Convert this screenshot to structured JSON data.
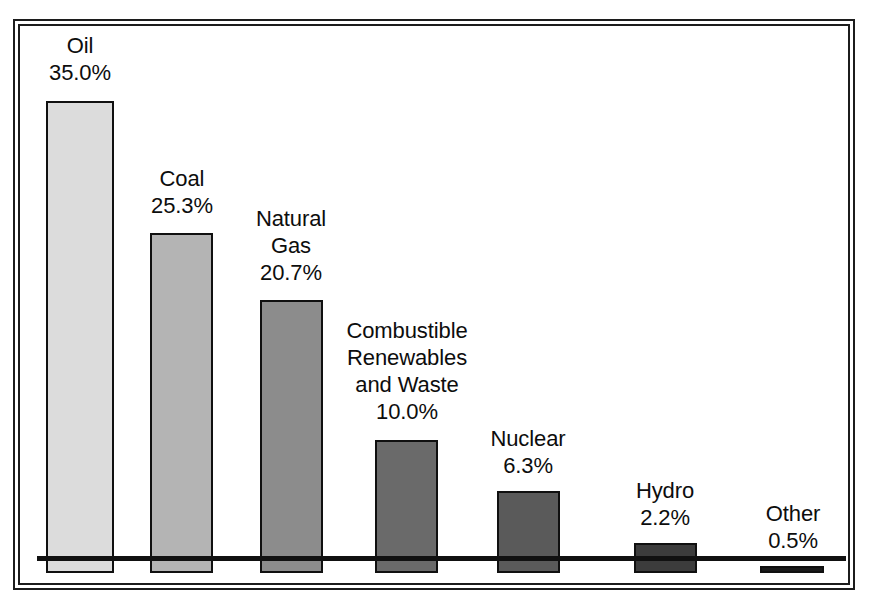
{
  "chart_data": {
    "type": "bar",
    "title": "",
    "subtitle": "",
    "xlabel": "",
    "ylabel": "",
    "grid": false,
    "legend": "none",
    "ylim": [
      0,
      35.0
    ],
    "unit": "%",
    "categories": [
      "Oil",
      "Coal",
      "Natural Gas",
      "Combustible Renewables and Waste",
      "Nuclear",
      "Hydro",
      "Other"
    ],
    "values": [
      35.0,
      25.3,
      20.7,
      10.0,
      6.3,
      2.2,
      0.5
    ],
    "value_labels": [
      "35.0%",
      "25.3%",
      "20.7%",
      "10.0%",
      "6.3%",
      "2.2%",
      "0.5%"
    ],
    "bar_colors": [
      "#dcdcdc",
      "#b4b4b4",
      "#8c8c8c",
      "#6a6a6a",
      "#5a5a5a",
      "#3c3c3c",
      "#1a1a1a"
    ],
    "bar_border_color": "#101010",
    "axis_color": "#111111",
    "frame_color": "#1c1c1c",
    "background": "#ffffff"
  },
  "bars": [
    {
      "name": "Oil",
      "name_lines": "Oil",
      "pct": "35.0%",
      "value": 35.0,
      "color": "#dcdcdc",
      "x": 46,
      "width": 68,
      "top": 101,
      "label_left": -24,
      "label_width": 116,
      "label_top": 32
    },
    {
      "name": "Coal",
      "name_lines": "Coal",
      "pct": "25.3%",
      "value": 25.3,
      "color": "#b4b4b4",
      "x": 150,
      "width": 63,
      "top": 233,
      "label_left": -26,
      "label_width": 116,
      "label_top": 165
    },
    {
      "name": "Natural Gas",
      "name_lines": "Natural\nGas",
      "pct": "20.7%",
      "value": 20.7,
      "color": "#8c8c8c",
      "x": 260,
      "width": 63,
      "top": 300,
      "label_left": -27,
      "label_width": 116,
      "label_top": 205
    },
    {
      "name": "Combustible Renewables and Waste",
      "name_lines": "Combustible\nRenewables\nand Waste",
      "pct": "10.0%",
      "value": 10.0,
      "color": "#6a6a6a",
      "x": 375,
      "width": 63,
      "top": 440,
      "label_left": -56,
      "label_width": 176,
      "label_top": 317
    },
    {
      "name": "Nuclear",
      "name_lines": "Nuclear",
      "pct": "6.3%",
      "value": 6.3,
      "color": "#5a5a5a",
      "x": 497,
      "width": 63,
      "top": 491,
      "label_left": -27,
      "label_width": 116,
      "label_top": 425
    },
    {
      "name": "Hydro",
      "name_lines": "Hydro",
      "pct": "2.2%",
      "value": 2.2,
      "color": "#3c3c3c",
      "x": 634,
      "width": 63,
      "top": 543,
      "label_left": -27,
      "label_width": 116,
      "label_top": 477
    },
    {
      "name": "Other",
      "name_lines": "Other",
      "pct": "0.5%",
      "value": 0.5,
      "color": "#1a1a1a",
      "x": 760,
      "width": 64,
      "top": 566,
      "label_left": -25,
      "label_width": 116,
      "label_top": 500
    }
  ],
  "layout": {
    "baseline_y": 573,
    "plot_left": 17,
    "plot_right": 850
  }
}
